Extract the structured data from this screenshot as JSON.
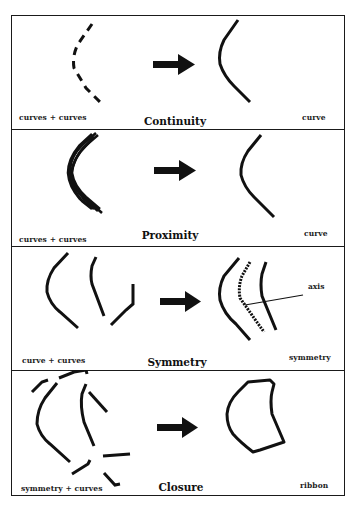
{
  "figure": {
    "panels": [
      {
        "id": "continuity",
        "title": "Continuity",
        "left_label": "curves + curves",
        "right_label": "curve"
      },
      {
        "id": "proximity",
        "title": "Proximity",
        "left_label": "curves + curves",
        "right_label": "curve"
      },
      {
        "id": "symmetry",
        "title": "Symmetry",
        "left_label": "curve + curves",
        "right_label": "symmetry",
        "annotation": "axis"
      },
      {
        "id": "closure",
        "title": "Closure",
        "left_label": "symmetry + curves",
        "right_label": "ribbon"
      }
    ],
    "icons": {
      "transform_arrow": "right-arrow-icon"
    },
    "colors": {
      "stroke": "#111111",
      "background": "#ffffff"
    }
  }
}
